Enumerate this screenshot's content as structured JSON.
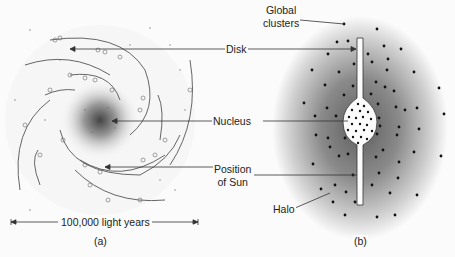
{
  "labels": {
    "global_clusters_line1": "Global",
    "global_clusters_line2": "clusters",
    "disk": "Disk",
    "nucleus": "Nucleus",
    "sun_line1": "Position",
    "sun_line2": "of Sun",
    "halo": "Halo",
    "scale": "100,000 light years",
    "panel_a": "(a)",
    "panel_b": "(b)"
  },
  "colors": {
    "background": "#fbfbfb",
    "ink": "#222222",
    "halo_dark": "#6a6a6a"
  }
}
